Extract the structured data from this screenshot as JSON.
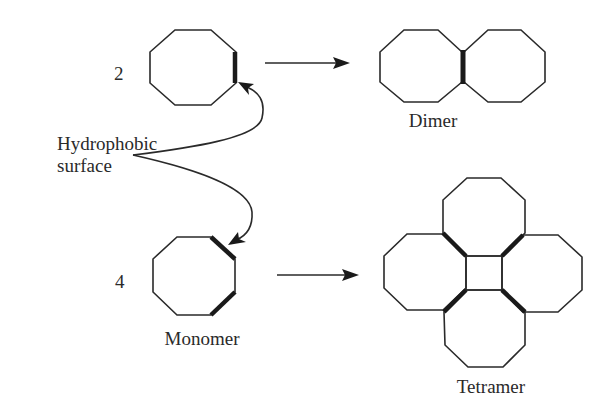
{
  "figure": {
    "top_row": {
      "count_label": "2",
      "product_label": "Dimer"
    },
    "bottom_row": {
      "count_label": "4",
      "monomer_label": "Monomer",
      "product_label": "Tetramer"
    },
    "annotation": {
      "line1": "Hydrophobic",
      "line2": "surface"
    },
    "colors": {
      "stroke": "#2a2a2a",
      "background": "#ffffff"
    }
  }
}
